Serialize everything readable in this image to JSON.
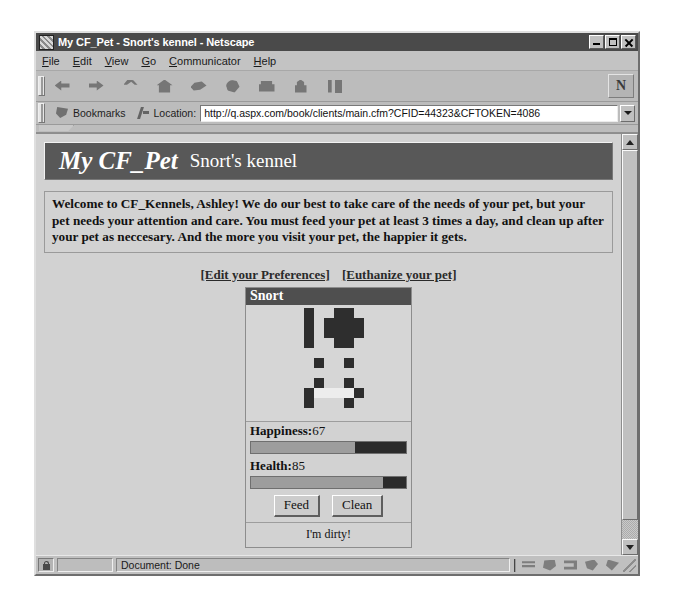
{
  "window": {
    "title": "My CF_Pet - Snort's kennel - Netscape",
    "icon": "netscape-document-icon",
    "controls": {
      "minimize": "minimize-button",
      "maximize": "maximize-button",
      "close": "close-button"
    }
  },
  "menu": {
    "items": [
      {
        "label": "File",
        "mnemonic": "F"
      },
      {
        "label": "Edit",
        "mnemonic": "E"
      },
      {
        "label": "View",
        "mnemonic": "V"
      },
      {
        "label": "Go",
        "mnemonic": "G"
      },
      {
        "label": "Communicator",
        "mnemonic": "C"
      },
      {
        "label": "Help",
        "mnemonic": "H"
      }
    ]
  },
  "toolbar": {
    "buttons": [
      {
        "name": "back-icon"
      },
      {
        "name": "forward-icon"
      },
      {
        "name": "reload-icon"
      },
      {
        "name": "home-icon"
      },
      {
        "name": "search-icon"
      },
      {
        "name": "guide-icon"
      },
      {
        "name": "print-icon"
      },
      {
        "name": "security-icon"
      },
      {
        "name": "stop-icon"
      }
    ],
    "logo_glyph": "N"
  },
  "location_bar": {
    "bookmarks_label": "Bookmarks",
    "location_label": "Location:",
    "url": "http://q.aspx.com/book/clients/main.cfm?CFID=44323&CFTOKEN=4086"
  },
  "page": {
    "banner": {
      "title": "My CF_Pet",
      "subtitle": "Snort's kennel"
    },
    "intro": "Welcome to CF_Kennels, Ashley! We do our best to take care of the needs of your pet, but your pet needs your attention and care. You must feed your pet at least 3 times a day, and clean up after your pet as neccesary. And the more you visit your pet, the happier it gets.",
    "links": [
      {
        "label": "[Edit your Preferences]"
      },
      {
        "label": "[Euthanize your pet]"
      }
    ],
    "pet": {
      "name": "Snort",
      "happiness_label": "Happiness:",
      "happiness_value": "67",
      "happiness_percent": 67,
      "health_label": "Health:",
      "health_value": "85",
      "health_percent": 85,
      "feed_button": "Feed",
      "clean_button": "Clean",
      "status": "I'm dirty!",
      "art_rows": [
        "00010011000",
        "00010111100",
        "00010111100",
        "00010011000",
        "00000000000",
        "00001001000",
        "00000000000",
        "00001001000",
        "00012222100",
        "00010001000",
        "00000000000"
      ]
    }
  },
  "status_bar": {
    "message": "Document: Done",
    "security_icon": "padlock-icon",
    "component_icons": [
      "navigator-icon",
      "mailbox-icon",
      "newsgroup-icon",
      "address-book-icon",
      "composer-icon"
    ]
  },
  "colors": {
    "banner_bg": "#585858",
    "chrome_bg": "#c0c0c0",
    "page_bg": "#d2d2d2",
    "titlebar_bg": "#4a4a4a",
    "bar_fill": "#9d9d9d",
    "bar_empty": "#2b2b2b"
  }
}
